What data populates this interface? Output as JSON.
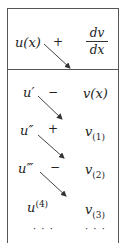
{
  "header": {
    "left": "u(x)",
    "sign": "+",
    "right_num": "dv",
    "right_den": "dx"
  },
  "rows": [
    {
      "u": "u",
      "u_mark": "′",
      "sign": "−",
      "v": "v(x)",
      "v_sub": ""
    },
    {
      "u": "u",
      "u_mark": "″",
      "sign": "+",
      "v": "v",
      "v_sub": "(1)"
    },
    {
      "u": "u",
      "u_mark": "‴",
      "sign": "−",
      "v": "v",
      "v_sub": "(2)"
    },
    {
      "u": "u",
      "u_mark": "(4)",
      "sign": "",
      "v": "v",
      "v_sub": "(3)"
    }
  ],
  "ellipsis": {
    "left": "· · ·",
    "right": "· · ·"
  },
  "colors": {
    "line": "#555555",
    "arrow": "#444444",
    "text": "#222222"
  }
}
